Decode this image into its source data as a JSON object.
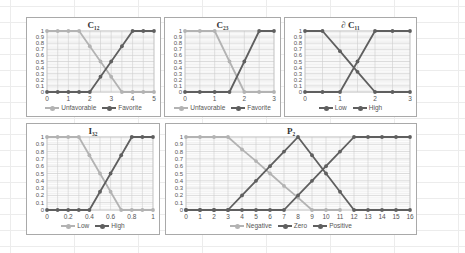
{
  "colors": {
    "light": "#b3b3b3",
    "dark": "#5f5f5f",
    "grid": "#cfcfcf",
    "axis_text": "#555555"
  },
  "chart_data": [
    {
      "id": "c12",
      "type": "line",
      "title": "C₁₂",
      "box": {
        "x": 26,
        "y": 17,
        "w": 135,
        "h": 100
      },
      "x": [
        0,
        0.5,
        1,
        1.5,
        2,
        2.5,
        3,
        3.5,
        4,
        4.5,
        5
      ],
      "xticks": [
        0,
        1,
        2,
        3,
        4,
        5
      ],
      "xlim": [
        0,
        5
      ],
      "ylim": [
        0,
        1
      ],
      "yticks": [
        0,
        0.1,
        0.2,
        0.3,
        0.4,
        0.5,
        0.6,
        0.7,
        0.8,
        0.9,
        1
      ],
      "grid": true,
      "legend_position": "bottom",
      "series": [
        {
          "name": "Unfavorable",
          "color": "light",
          "values": [
            1,
            1,
            1,
            1,
            0.75,
            0.5,
            0.25,
            0,
            0,
            0,
            0
          ]
        },
        {
          "name": "Favorite",
          "color": "dark",
          "values": [
            0,
            0,
            0,
            0,
            0,
            0.25,
            0.5,
            0.75,
            1,
            1,
            1
          ]
        }
      ]
    },
    {
      "id": "c23",
      "type": "line",
      "title": "C₂₃",
      "box": {
        "x": 164,
        "y": 17,
        "w": 117,
        "h": 100
      },
      "x": [
        0,
        0.5,
        1,
        1.5,
        2,
        2.5,
        3
      ],
      "xticks": [
        0,
        1,
        2,
        3
      ],
      "xlim": [
        0,
        3
      ],
      "ylim": [
        0,
        1
      ],
      "yticks": [
        0,
        0.1,
        0.2,
        0.3,
        0.4,
        0.5,
        0.6,
        0.7,
        0.8,
        0.9,
        1
      ],
      "grid": true,
      "legend_position": "bottom",
      "series": [
        {
          "name": "Unfavorable",
          "color": "light",
          "values": [
            1,
            1,
            1,
            0.5,
            0,
            0,
            0
          ]
        },
        {
          "name": "Favorite",
          "color": "dark",
          "values": [
            0,
            0,
            0,
            0,
            0.5,
            1,
            1
          ]
        }
      ]
    },
    {
      "id": "dc11",
      "type": "line",
      "title": "∂ C₁₁",
      "box": {
        "x": 284,
        "y": 17,
        "w": 133,
        "h": 100
      },
      "x": [
        0,
        0.5,
        1,
        1.5,
        2,
        2.5,
        3
      ],
      "xticks": [
        0,
        1,
        2,
        3
      ],
      "xlim": [
        0,
        3
      ],
      "ylim": [
        0,
        1
      ],
      "yticks": [
        0,
        0.1,
        0.2,
        0.3,
        0.4,
        0.5,
        0.6,
        0.7,
        0.8,
        0.9,
        1
      ],
      "grid": true,
      "legend_position": "bottom",
      "series": [
        {
          "name": "Low",
          "color": "dark",
          "values": [
            1,
            1,
            0.67,
            0.33,
            0,
            0,
            0
          ]
        },
        {
          "name": "High",
          "color": "dark",
          "values": [
            0,
            0,
            0,
            0.5,
            1,
            1,
            1
          ]
        }
      ]
    },
    {
      "id": "i32",
      "type": "line",
      "title": "I₃₂",
      "box": {
        "x": 26,
        "y": 123,
        "w": 134,
        "h": 112
      },
      "x": [
        0,
        0.1,
        0.2,
        0.3,
        0.4,
        0.5,
        0.6,
        0.7,
        0.8,
        0.9,
        1
      ],
      "xticks": [
        0,
        0.2,
        0.4,
        0.6,
        0.8,
        1
      ],
      "xlim": [
        0,
        1
      ],
      "ylim": [
        0,
        1
      ],
      "yticks": [
        0,
        0.1,
        0.2,
        0.3,
        0.4,
        0.5,
        0.6,
        0.7,
        0.8,
        0.9,
        1
      ],
      "grid": true,
      "legend_position": "bottom",
      "series": [
        {
          "name": "Low",
          "color": "light",
          "values": [
            1,
            1,
            1,
            1,
            0.75,
            0.5,
            0.25,
            0,
            0,
            0,
            0
          ]
        },
        {
          "name": "High",
          "color": "dark",
          "values": [
            0,
            0,
            0,
            0,
            0,
            0.25,
            0.5,
            0.75,
            1,
            1,
            1
          ]
        }
      ]
    },
    {
      "id": "p2",
      "type": "line",
      "title": "P₂",
      "box": {
        "x": 165,
        "y": 123,
        "w": 252,
        "h": 112
      },
      "x": [
        0,
        1,
        2,
        3,
        4,
        5,
        6,
        7,
        8,
        9,
        10,
        11,
        12,
        13,
        14,
        15,
        16
      ],
      "xticks": [
        0,
        1,
        2,
        3,
        4,
        5,
        6,
        7,
        8,
        9,
        10,
        11,
        12,
        13,
        14,
        15,
        16
      ],
      "xlim": [
        0,
        16
      ],
      "ylim": [
        0,
        1
      ],
      "yticks": [
        0,
        0.1,
        0.2,
        0.3,
        0.4,
        0.5,
        0.6,
        0.7,
        0.8,
        0.9,
        1
      ],
      "grid": true,
      "legend_position": "bottom",
      "series": [
        {
          "name": "Negative",
          "color": "light",
          "values": [
            1,
            1,
            1,
            1,
            0.83,
            0.67,
            0.5,
            0.33,
            0.17,
            0,
            0,
            0,
            null,
            null,
            null,
            null,
            null
          ]
        },
        {
          "name": "Zero",
          "color": "dark",
          "values": [
            0,
            0,
            0,
            0,
            0.2,
            0.4,
            0.6,
            0.8,
            1,
            0.75,
            0.5,
            0.25,
            0,
            0,
            0,
            0,
            0
          ]
        },
        {
          "name": "Positive",
          "color": "dark",
          "values": [
            0,
            0,
            0,
            0,
            0,
            0,
            0,
            0,
            0.2,
            0.4,
            0.6,
            0.8,
            1,
            1,
            1,
            1,
            1
          ]
        }
      ]
    }
  ]
}
